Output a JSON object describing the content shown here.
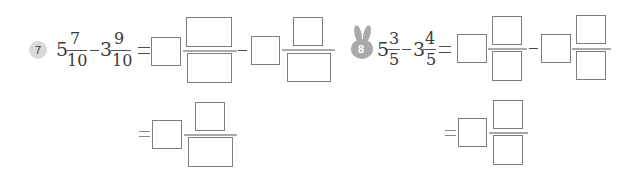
{
  "problems": [
    {
      "number": "7",
      "badge_style": "circle",
      "expression": {
        "whole1": "5",
        "num1": "7",
        "den1": "10",
        "operator": "−",
        "whole2": "3",
        "num2": "9",
        "den2": "10",
        "equals": "="
      },
      "answer_row1": {
        "term1": {
          "whole": "",
          "numerator": "",
          "denominator": ""
        },
        "operator": "−",
        "term2": {
          "whole": "",
          "numerator": "",
          "denominator": ""
        }
      },
      "answer_row2": {
        "equals": "=",
        "result": {
          "whole": "",
          "numerator": "",
          "denominator": ""
        }
      }
    },
    {
      "number": "8",
      "badge_style": "rabbit",
      "expression": {
        "whole1": "5",
        "num1": "3",
        "den1": "5",
        "operator": "−",
        "whole2": "3",
        "num2": "4",
        "den2": "5",
        "equals": "="
      },
      "answer_row1": {
        "term1": {
          "whole": "",
          "numerator": "",
          "denominator": ""
        },
        "operator": "−",
        "term2": {
          "whole": "",
          "numerator": "",
          "denominator": ""
        }
      },
      "answer_row2": {
        "equals": "=",
        "result": {
          "whole": "",
          "numerator": "",
          "denominator": ""
        }
      }
    }
  ],
  "colors": {
    "box_border": "#7d7d7d",
    "fraction_line": "#a8a8a8",
    "badge_circle": "#d9d9d9",
    "rabbit_badge": "#a9a9a9",
    "text": "#3a3a3a"
  }
}
